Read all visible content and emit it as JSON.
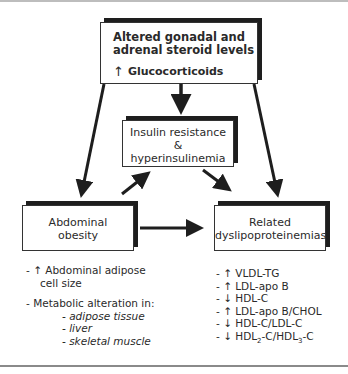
{
  "diagram": {
    "top_box": {
      "line1": "Altered gonadal and",
      "line2": "adrenal steroid levels",
      "gluco_arrow": "↑",
      "gluco_label": "Glucocorticoids"
    },
    "middle_box": {
      "line1": "Insulin resistance",
      "line2": "&",
      "line3": "hyperinsulinemia"
    },
    "left_box": {
      "line1": "Abdominal",
      "line2": "obesity"
    },
    "right_box": {
      "line1": "Related",
      "line2": "dyslipoproteinemias"
    },
    "left_list": {
      "item1_line1": "- ↑ Abdominal adipose",
      "item1_line2": "cell size",
      "item2": "- Metabolic alteration in:",
      "subitems": [
        "- adipose tissue",
        "- liver",
        "- skeletal muscle"
      ]
    },
    "right_list": {
      "items": [
        "- ↑ VLDL-TG",
        "- ↑ LDL-apo B",
        "- ↓ HDL-C",
        "- ↑ LDL-apo B/CHOL",
        "- ↓ HDL-C/LDL-C"
      ],
      "last_prefix": "- ↓ HDL",
      "last_sub1": "2",
      "last_mid": "-C/HDL",
      "last_sub2": "3",
      "last_suffix": "-C"
    }
  }
}
